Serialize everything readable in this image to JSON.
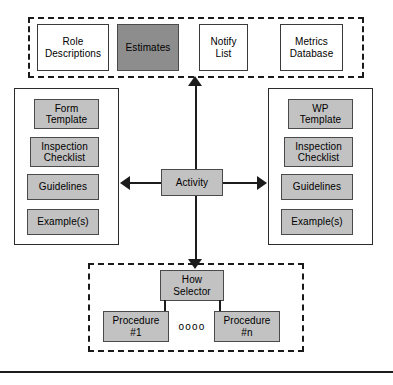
{
  "diagram": {
    "colors": {
      "fill_light": "#c2c2c2",
      "fill_dark": "#8d8d8d",
      "fill_plain": "#ffffff",
      "stroke": "#3a3a3a",
      "connector": "#1c1c1c",
      "dashed_stroke": "#1a1a1a"
    },
    "top_group": {
      "name": "top-dashed-group",
      "nodes": [
        {
          "label": "Role\nDescriptions",
          "fill": "plain"
        },
        {
          "label": "Estimates",
          "fill": "dark"
        },
        {
          "label": "Notify\nList",
          "fill": "plain"
        },
        {
          "label": "Metrics\nDatabase",
          "fill": "plain"
        }
      ]
    },
    "left_group": {
      "name": "left-solid-group",
      "nodes": [
        {
          "label": "Form\nTemplate",
          "fill": "light"
        },
        {
          "label": "Inspection\nChecklist",
          "fill": "light"
        },
        {
          "label": "Guidelines",
          "fill": "light"
        },
        {
          "label": "Example(s)",
          "fill": "light"
        }
      ]
    },
    "right_group": {
      "name": "right-solid-group",
      "nodes": [
        {
          "label": "WP\nTemplate",
          "fill": "light"
        },
        {
          "label": "Inspection\nChecklist",
          "fill": "light"
        },
        {
          "label": "Guidelines",
          "fill": "light"
        },
        {
          "label": "Example(s)",
          "fill": "light"
        }
      ]
    },
    "center": {
      "name": "activity-node",
      "label": "Activity",
      "fill": "light"
    },
    "bottom_group": {
      "name": "bottom-dashed-group",
      "selector": {
        "label": "How\nSelector",
        "fill": "light"
      },
      "procedures": [
        {
          "label": "Procedure\n#1",
          "fill": "light"
        },
        {
          "label": "Procedure\n#n",
          "fill": "light"
        }
      ],
      "ellipsis": "oooo"
    },
    "connectors": [
      {
        "name": "activity-to-top-arrow",
        "direction": "up",
        "from": "Activity",
        "to": "top-dashed-group"
      },
      {
        "name": "activity-to-left-arrow",
        "direction": "left",
        "from": "Activity",
        "to": "left-solid-group"
      },
      {
        "name": "activity-to-right-arrow",
        "direction": "right",
        "from": "Activity",
        "to": "right-solid-group"
      },
      {
        "name": "activity-to-bottom-arrow",
        "direction": "down",
        "from": "Activity",
        "to": "How Selector"
      },
      {
        "name": "selector-to-procedure-1-link",
        "direction": "down",
        "from": "How Selector",
        "to": "Procedure #1"
      },
      {
        "name": "selector-to-procedure-n-link",
        "direction": "down",
        "from": "How Selector",
        "to": "Procedure #n"
      }
    ]
  }
}
